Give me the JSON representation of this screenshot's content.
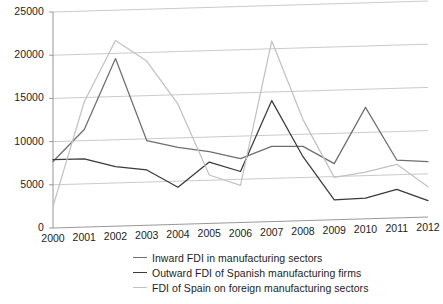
{
  "chart_data": {
    "type": "line",
    "title": "",
    "subtitle": "",
    "xlabel": "",
    "ylabel": "",
    "grid": true,
    "legend_position": "bottom",
    "categories": [
      "2000",
      "2001",
      "2002",
      "2003",
      "2004",
      "2005",
      "2006",
      "2007",
      "2008",
      "2009",
      "2010",
      "2011",
      "2012"
    ],
    "x": [
      2000,
      2001,
      2002,
      2003,
      2004,
      2005,
      2006,
      2007,
      2008,
      2009,
      2010,
      2011,
      2012
    ],
    "xlim": [
      2000,
      2012
    ],
    "ylim": [
      0,
      25000
    ],
    "yticks": [
      0,
      5000,
      10000,
      15000,
      20000,
      25000
    ],
    "ytick_labels": [
      "0",
      "5000",
      "10000",
      "15000",
      "20000",
      "25000"
    ],
    "series": [
      {
        "name": "Inward FDI in manufacturing sectors",
        "color": "#6e6e6e",
        "values": [
          7700,
          11300,
          19400,
          9800,
          8900,
          8300,
          7400,
          8700,
          8600,
          6500,
          12900,
          6700,
          6400
        ]
      },
      {
        "name": "Outward FDI of Spanish manufacturing firms",
        "color": "#3a3a3a",
        "values": [
          7900,
          7900,
          6900,
          6400,
          4300,
          7100,
          5900,
          14000,
          7400,
          2300,
          2400,
          3300,
          1900
        ]
      },
      {
        "name": "FDI of Spain on foreign manufacturing sectors",
        "color": "#c2c2c2",
        "values": [
          2500,
          14500,
          21500,
          19000,
          13900,
          5600,
          4300,
          20900,
          11700,
          4900,
          5400,
          6200,
          3500
        ]
      }
    ]
  },
  "axes": {
    "y_labels": [
      "25000",
      "20000",
      "15000",
      "10000",
      "5000",
      "0"
    ],
    "x_labels": [
      "2000",
      "2001",
      "2002",
      "2003",
      "2004",
      "2005",
      "2006",
      "2007",
      "2008",
      "2009",
      "2010",
      "2011",
      "2012"
    ]
  },
  "legend": {
    "items": [
      {
        "label": "Inward FDI in manufacturing sectors",
        "color": "#6e6e6e"
      },
      {
        "label": "Outward FDI of Spanish manufacturing firms",
        "color": "#3a3a3a"
      },
      {
        "label": "FDI of Spain on foreign manufacturing sectors",
        "color": "#c2c2c2"
      }
    ]
  }
}
